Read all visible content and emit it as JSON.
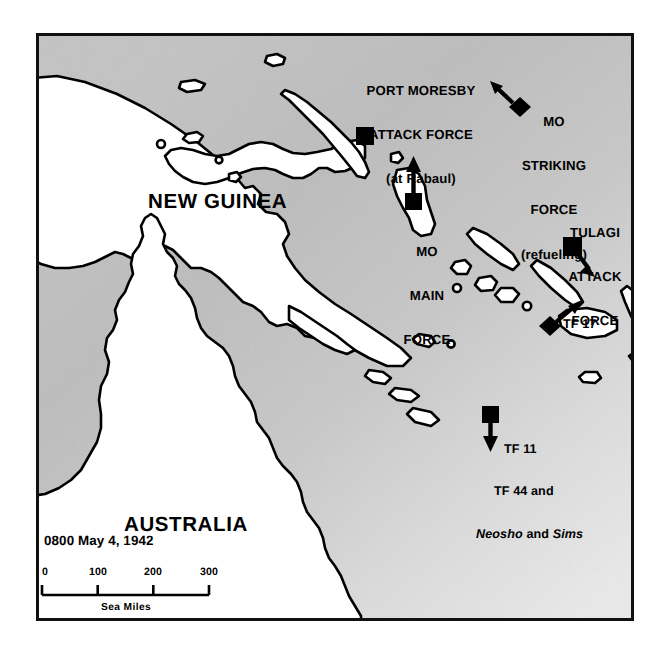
{
  "figure": {
    "type": "historical-military-map",
    "region_labels": [
      {
        "name": "new-guinea",
        "text": "NEW GUINEA",
        "x": 145,
        "y": 196
      },
      {
        "name": "australia",
        "text": "AUSTRALIA",
        "x": 121,
        "y": 519
      }
    ],
    "force_labels": [
      {
        "name": "port-moresby-attack-force",
        "lines": [
          "PORT MORESBY",
          "ATTACK FORCE",
          "(at Rabaul)"
        ],
        "x": 418,
        "y": 56
      },
      {
        "name": "mo-striking-force",
        "lines": [
          "MO",
          "STRIKING",
          "FORCE",
          "(refueling)"
        ],
        "x": 551,
        "y": 88
      },
      {
        "name": "mo-main-force",
        "lines": [
          "MO",
          "MAIN",
          "FORCE"
        ],
        "x": 424,
        "y": 218
      },
      {
        "name": "tulagi-attack-force",
        "lines": [
          "TULAGI",
          "ATTACK",
          "FORCE"
        ],
        "x": 592,
        "y": 199
      }
    ],
    "task_force_labels": [
      {
        "name": "tf-17",
        "text": "TF 17",
        "x": 571,
        "y": 319
      }
    ],
    "tf11_block": {
      "name": "tf-11-group",
      "line1": "TF 11",
      "line2": "TF 44 and",
      "line3_italic_a": "Neosho",
      "line3_plain": " and ",
      "line3_italic_b": "Sims",
      "x": 511,
      "y": 417
    },
    "datestamp": {
      "text": "0800 May 4, 1942",
      "x": 41,
      "y": 537
    },
    "scale_bar": {
      "name": "scale-bar",
      "ticks": [
        "0",
        "100",
        "200",
        "300"
      ],
      "caption": "Sea Miles",
      "units": "Sea Miles",
      "max_value": 300,
      "x": 38,
      "y": 572,
      "width": 167
    },
    "markers": [
      {
        "name": "marker-port-moresby-attack-force",
        "shape": "square",
        "x": 362,
        "y": 133,
        "size": 17,
        "arrow": null
      },
      {
        "name": "marker-mo-striking-force",
        "shape": "diamond",
        "x": 508,
        "y": 113,
        "size": 18,
        "arrow": "up-left"
      },
      {
        "name": "marker-mo-main-force",
        "shape": "square",
        "x": 411,
        "y": 198,
        "size": 15,
        "arrow": "up"
      },
      {
        "name": "marker-tulagi-attack-force",
        "shape": "square",
        "x": 577,
        "y": 249,
        "size": 16,
        "arrow": "down-right"
      },
      {
        "name": "marker-tf-17",
        "shape": "diamond",
        "x": 550,
        "y": 316,
        "size": 18,
        "arrow": "up-right"
      },
      {
        "name": "marker-tf-11",
        "shape": "square",
        "x": 488,
        "y": 418,
        "size": 15,
        "arrow": "down"
      }
    ],
    "colors": {
      "land": "#ffffff",
      "sea_dark": "#b9b9b9",
      "sea_light": "#e3e3e3",
      "coastline": "#000000",
      "frame": "#111111",
      "text": "#000000",
      "page": "#ffffff"
    }
  }
}
